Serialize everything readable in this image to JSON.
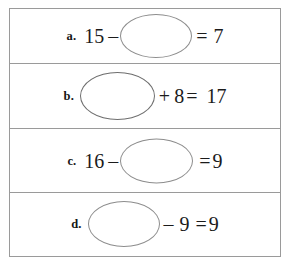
{
  "worksheet": {
    "type": "math-fill-in-the-blank",
    "blank_symbol": "oval",
    "rows": [
      {
        "label": "a.",
        "sequence": [
          "15",
          "–",
          "oval",
          "=",
          "7"
        ],
        "left_operand": "15",
        "operator": "–",
        "right_operand": "oval",
        "equals": "=",
        "result": "7"
      },
      {
        "label": "b.",
        "sequence": [
          "oval",
          "+",
          "8",
          "=",
          "17"
        ],
        "left_operand": "oval",
        "operator": "+",
        "right_operand": "8",
        "equals": "=",
        "result": "17"
      },
      {
        "label": "c.",
        "sequence": [
          "16",
          "–",
          "oval",
          "=",
          "9"
        ],
        "left_operand": "16",
        "operator": "–",
        "right_operand": "oval",
        "equals": "=",
        "result": "9"
      },
      {
        "label": "d.",
        "sequence": [
          "oval",
          "–",
          "9",
          "=",
          "9"
        ],
        "left_operand": "oval",
        "operator": "–",
        "right_operand": "9",
        "equals": "=",
        "result": "9"
      }
    ]
  },
  "colors": {
    "border": "#9a9a9a",
    "oval_stroke": "#8d8d8d",
    "oval_stroke_dark": "#6e6e6e",
    "text": "#1b1b1b",
    "background": "#ffffff"
  }
}
